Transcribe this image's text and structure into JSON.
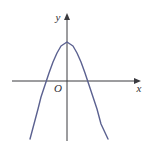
{
  "figure": {
    "background_color": "#ffffff",
    "width": 150,
    "height": 145
  },
  "labels": {
    "x_axis": "x",
    "y_axis": "y",
    "origin": "O"
  },
  "colors": {
    "axis": "#3a3a3f",
    "curve": "#5b6190",
    "background": "#ffffff",
    "label": "#2e2e33"
  },
  "chart_data": {
    "type": "line",
    "title": "",
    "xlabel": "x",
    "ylabel": "y",
    "grid": false,
    "legend": false,
    "axes": {
      "x_axis_y_pixel": 81,
      "y_axis_x_pixel": 67,
      "x_start_pixel": 12,
      "x_end_pixel": 141,
      "y_top_pixel": 13,
      "y_bottom_pixel": 141,
      "x_arrow": true,
      "y_arrow": true
    },
    "curve": {
      "name": "parabola",
      "equation": "y = a(x - h)^2 + k, a < 0",
      "opens": "down",
      "vertex": [
        0,
        1
      ],
      "vertex_pixel": [
        67,
        42
      ],
      "roots": [
        -1,
        1
      ],
      "root_pixels": [
        41,
        93
      ],
      "y_intercept": 1,
      "points_pixel": [
        [
          30,
          139
        ],
        [
          34,
          124
        ],
        [
          38,
          109
        ],
        [
          41,
          97
        ],
        [
          45,
          85
        ],
        [
          49,
          73
        ],
        [
          53,
          62
        ],
        [
          57,
          53
        ],
        [
          61,
          46
        ],
        [
          67,
          42
        ],
        [
          73,
          46
        ],
        [
          77,
          53
        ],
        [
          81,
          62
        ],
        [
          85,
          73
        ],
        [
          89,
          85
        ],
        [
          93,
          97
        ],
        [
          97,
          109
        ],
        [
          101,
          124
        ],
        [
          108,
          139
        ]
      ]
    }
  }
}
